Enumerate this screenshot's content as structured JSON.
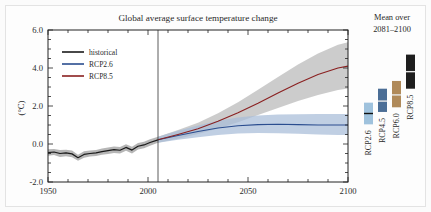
{
  "figure": {
    "background_color": "#fbfbfb",
    "frame_color": "#e3e3e3"
  },
  "chart_data": {
    "type": "line",
    "title": "Global average surface temperature change",
    "xlabel": "",
    "ylabel": "(°C)",
    "xlim": [
      1950,
      2100
    ],
    "ylim": [
      -2.0,
      6.0
    ],
    "xticks": [
      1950,
      2000,
      2050,
      2100
    ],
    "xtick_labels": [
      "1950",
      "2000",
      "2050",
      "2100"
    ],
    "yticks": [
      -2.0,
      0.0,
      2.0,
      4.0,
      6.0
    ],
    "ytick_labels": [
      "-2.0",
      "0.0",
      "2.0",
      "4.0",
      "6.0"
    ],
    "grid": false,
    "legend_position": "upper left",
    "reference_line_x": 2005,
    "series": [
      {
        "name": "historical",
        "color": "#1a1a1a",
        "band_color": "#9a9a9a",
        "x": [
          1950,
          1953,
          1956,
          1959,
          1962,
          1965,
          1968,
          1971,
          1974,
          1977,
          1980,
          1983,
          1986,
          1989,
          1992,
          1995,
          1998,
          2001,
          2005
        ],
        "values": [
          -0.45,
          -0.42,
          -0.5,
          -0.47,
          -0.52,
          -0.72,
          -0.55,
          -0.5,
          -0.47,
          -0.4,
          -0.35,
          -0.3,
          -0.33,
          -0.18,
          -0.32,
          -0.12,
          -0.05,
          0.08,
          0.22
        ],
        "band_lower": [
          -0.62,
          -0.58,
          -0.68,
          -0.64,
          -0.7,
          -0.88,
          -0.72,
          -0.66,
          -0.63,
          -0.56,
          -0.52,
          -0.47,
          -0.5,
          -0.35,
          -0.5,
          -0.29,
          -0.22,
          -0.09,
          0.06
        ],
        "band_upper": [
          -0.28,
          -0.26,
          -0.32,
          -0.3,
          -0.34,
          -0.56,
          -0.38,
          -0.34,
          -0.31,
          -0.24,
          -0.18,
          -0.13,
          -0.16,
          -0.01,
          -0.14,
          0.05,
          0.12,
          0.25,
          0.38
        ]
      },
      {
        "name": "RCP2.6",
        "color": "#2a4d8f",
        "band_color": "#a8bcd8",
        "x": [
          2005,
          2015,
          2025,
          2035,
          2045,
          2055,
          2065,
          2075,
          2085,
          2095,
          2100
        ],
        "values": [
          0.22,
          0.45,
          0.66,
          0.84,
          0.96,
          1.02,
          1.04,
          1.02,
          1.0,
          1.0,
          1.0
        ],
        "band_lower": [
          0.06,
          0.22,
          0.36,
          0.48,
          0.55,
          0.58,
          0.57,
          0.54,
          0.5,
          0.48,
          0.47
        ],
        "band_upper": [
          0.38,
          0.7,
          0.98,
          1.22,
          1.4,
          1.5,
          1.55,
          1.57,
          1.58,
          1.58,
          1.58
        ]
      },
      {
        "name": "RCP8.5",
        "color": "#8a2020",
        "band_color": "#b8b8b8",
        "x": [
          2005,
          2015,
          2025,
          2035,
          2045,
          2055,
          2065,
          2075,
          2085,
          2095,
          2100
        ],
        "values": [
          0.22,
          0.5,
          0.8,
          1.2,
          1.65,
          2.15,
          2.68,
          3.2,
          3.66,
          4.0,
          4.1
        ],
        "band_lower": [
          0.06,
          0.28,
          0.52,
          0.82,
          1.15,
          1.52,
          1.9,
          2.26,
          2.58,
          2.84,
          2.92
        ],
        "band_upper": [
          0.38,
          0.74,
          1.12,
          1.62,
          2.2,
          2.86,
          3.52,
          4.18,
          4.76,
          5.22,
          5.35
        ]
      }
    ],
    "legend_entries": [
      {
        "label": "historical",
        "color": "#1a1a1a"
      },
      {
        "label": "RCP2.6",
        "color": "#2a4d8f"
      },
      {
        "label": "RCP8.5",
        "color": "#8a2020"
      }
    ]
  },
  "side_panel": {
    "title_line1": "Mean over",
    "title_line2": "2081–2100",
    "ylim": [
      -2.0,
      6.0
    ],
    "bars": [
      {
        "label": "RCP2.6",
        "color": "#9fc2dd",
        "low": 0.3,
        "high": 1.7,
        "mean": 1.0
      },
      {
        "label": "RCP4.5",
        "color": "#4b6e96",
        "low": 1.1,
        "high": 2.6,
        "mean": 1.8
      },
      {
        "label": "RCP6.0",
        "color": "#b08a5a",
        "low": 1.4,
        "high": 3.1,
        "mean": 2.2
      },
      {
        "label": "RCP8.5",
        "color": "#1e1e1e",
        "low": 2.6,
        "high": 4.8,
        "mean": 3.7
      }
    ]
  }
}
